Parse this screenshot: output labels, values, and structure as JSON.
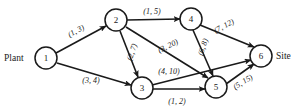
{
  "diagram": {
    "type": "directed-network",
    "terminals": {
      "source_label": "Plant",
      "sink_label": "Site"
    },
    "nodes": [
      {
        "id": "1",
        "label": "1",
        "x": 46,
        "y": 58,
        "r": 11
      },
      {
        "id": "2",
        "label": "2",
        "x": 116,
        "y": 20,
        "r": 11
      },
      {
        "id": "3",
        "label": "3",
        "x": 142,
        "y": 88,
        "r": 11
      },
      {
        "id": "4",
        "label": "4",
        "x": 191,
        "y": 19,
        "r": 11
      },
      {
        "id": "5",
        "label": "5",
        "x": 216,
        "y": 87,
        "r": 11
      },
      {
        "id": "6",
        "label": "6",
        "x": 261,
        "y": 56,
        "r": 11
      }
    ],
    "edges": [
      {
        "from": "1",
        "to": "2",
        "label": "(1, 3)",
        "lx": 76,
        "ly": 31,
        "rot": -29
      },
      {
        "from": "1",
        "to": "3",
        "label": "(3, 4)",
        "lx": 91,
        "ly": 80,
        "rot": 0
      },
      {
        "from": "2",
        "to": "4",
        "label": "(1, 5)",
        "lx": 152,
        "ly": 11,
        "rot": 0
      },
      {
        "from": "2",
        "to": "3",
        "label": "(2, 7)",
        "lx": 132,
        "ly": 52,
        "rot": -71
      },
      {
        "from": "2",
        "to": "5",
        "label": "(3, 20)",
        "lx": 168,
        "ly": 46,
        "rot": -26
      },
      {
        "from": "3",
        "to": "6",
        "label": "(4, 10)",
        "lx": 169,
        "ly": 71,
        "rot": 0
      },
      {
        "from": "3",
        "to": "5",
        "label": "(1, 2)",
        "lx": 177,
        "ly": 101,
        "rot": 0
      },
      {
        "from": "4",
        "to": "6",
        "label": "(7, 12)",
        "lx": 224,
        "ly": 26,
        "rot": -28
      },
      {
        "from": "4",
        "to": "5",
        "label": "(6, 8)",
        "lx": 203,
        "ly": 47,
        "rot": -72
      },
      {
        "from": "5",
        "to": "6",
        "label": "(5, 15)",
        "lx": 243,
        "ly": 82,
        "rot": -32
      }
    ],
    "legend_note": "Each edge label shows (lower bound, upper bound)"
  }
}
